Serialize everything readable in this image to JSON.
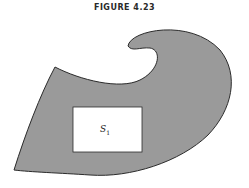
{
  "figure": {
    "title": "FIGURE 4.23",
    "region_label": "S",
    "region_label_subscript": "1",
    "colors": {
      "fill": "#9a9a9a",
      "stroke": "#2b2b2b",
      "inner": "#ffffff"
    }
  }
}
